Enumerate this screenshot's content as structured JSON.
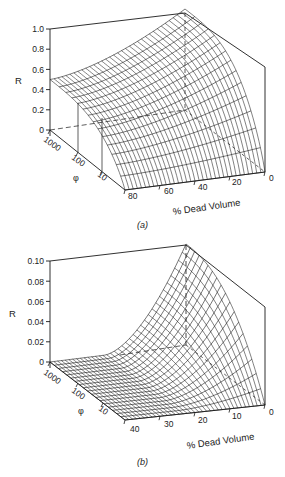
{
  "chart_data": [
    {
      "id": "a",
      "type": "surface3d",
      "caption": "(a)",
      "zlabel": "R",
      "xlabel": "% Dead Volume",
      "ylabel": "φ",
      "z_ticks": [
        "0",
        "0.2",
        "0.4",
        "0.6",
        "0.8",
        "1.0"
      ],
      "z_range": [
        0,
        1.0
      ],
      "x_ticks": [
        "80",
        "60",
        "40",
        "20",
        "0"
      ],
      "x_range": [
        80,
        0
      ],
      "y_ticks": [
        "1000",
        "100",
        "10"
      ],
      "y_scale": "log",
      "description": "R surface: approx 0.5 at 80% dead volume across all φ, rising smoothly to 1.0 at 0% dead volume for large φ; drops steeply toward 0 at small φ (10) near 0% dead volume edge.",
      "sample_values": [
        {
          "dead_volume": 80,
          "phi": 1000,
          "R": 0.5
        },
        {
          "dead_volume": 0,
          "phi": 1000,
          "R": 1.0
        },
        {
          "dead_volume": 80,
          "phi": 10,
          "R": 0.0
        },
        {
          "dead_volume": 0,
          "phi": 10,
          "R": 0.0
        }
      ]
    },
    {
      "id": "b",
      "type": "surface3d",
      "caption": "(b)",
      "zlabel": "R",
      "xlabel": "% Dead Volume",
      "ylabel": "φ",
      "z_ticks": [
        "0",
        "0.02",
        "0.04",
        "0.06",
        "0.08",
        "0.10"
      ],
      "z_range": [
        0,
        0.1
      ],
      "x_ticks": [
        "40",
        "30",
        "20",
        "10",
        "0"
      ],
      "x_range": [
        40,
        0
      ],
      "y_ticks": [
        "1000",
        "100",
        "10"
      ],
      "y_scale": "log",
      "description": "R surface near 0 across most of the domain (flat at large dead volume), rising sharply to 0.10 at 0% dead volume and large φ.",
      "sample_values": [
        {
          "dead_volume": 40,
          "phi": 1000,
          "R": 0.0
        },
        {
          "dead_volume": 0,
          "phi": 1000,
          "R": 0.1
        },
        {
          "dead_volume": 40,
          "phi": 10,
          "R": 0.0
        },
        {
          "dead_volume": 0,
          "phi": 10,
          "R": 0.0
        }
      ]
    }
  ],
  "panels": {
    "a": {
      "caption": "(a)",
      "r_label": "R",
      "phi_label": "φ",
      "x_title": "% Dead Volume",
      "z_ticks": [
        "0",
        "0.2",
        "0.4",
        "0.6",
        "0.8",
        "1.0"
      ],
      "x_ticks": [
        "80",
        "60",
        "40",
        "20",
        "0"
      ],
      "phi_ticks": [
        "1000",
        "100",
        "10"
      ]
    },
    "b": {
      "caption": "(b)",
      "r_label": "R",
      "phi_label": "φ",
      "x_title": "% Dead Volume",
      "z_ticks": [
        "0",
        "0.02",
        "0.04",
        "0.06",
        "0.08",
        "0.10"
      ],
      "x_ticks": [
        "40",
        "30",
        "20",
        "10",
        "0"
      ],
      "phi_ticks": [
        "1000",
        "100",
        "10"
      ]
    }
  }
}
